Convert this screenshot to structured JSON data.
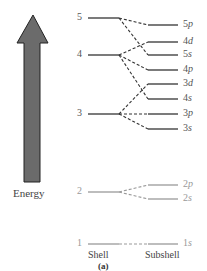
{
  "diagram": {
    "axis_label": "Energy",
    "column_labels": {
      "shell": "Shell",
      "subshell": "Subshell"
    },
    "caption": "(a)",
    "colors": {
      "arrow_fill": "#6b6b6b",
      "arrow_stroke": "#222222",
      "line_dark": "#333333",
      "line_light": "#999999",
      "text_dark": "#555555",
      "text_light": "#999999"
    },
    "shells": [
      {
        "n": "5",
        "y": 18
      },
      {
        "n": "4",
        "y": 55
      },
      {
        "n": "3",
        "y": 114
      },
      {
        "n": "2",
        "y": 192
      },
      {
        "n": "1",
        "y": 244
      }
    ],
    "subshells": [
      {
        "n": "5",
        "l": "p",
        "y": 25,
        "shell": "5"
      },
      {
        "n": "4",
        "l": "d",
        "y": 42,
        "shell": "4"
      },
      {
        "n": "5",
        "l": "s",
        "y": 55,
        "shell": "5"
      },
      {
        "n": "4",
        "l": "p",
        "y": 70,
        "shell": "4"
      },
      {
        "n": "3",
        "l": "d",
        "y": 84,
        "shell": "3"
      },
      {
        "n": "4",
        "l": "s",
        "y": 99,
        "shell": "4"
      },
      {
        "n": "3",
        "l": "p",
        "y": 114,
        "shell": "3"
      },
      {
        "n": "3",
        "l": "s",
        "y": 129,
        "shell": "3"
      },
      {
        "n": "2",
        "l": "p",
        "y": 185,
        "shell": "2"
      },
      {
        "n": "2",
        "l": "s",
        "y": 199,
        "shell": "2"
      },
      {
        "n": "1",
        "l": "s",
        "y": 244,
        "shell": "1"
      }
    ]
  }
}
